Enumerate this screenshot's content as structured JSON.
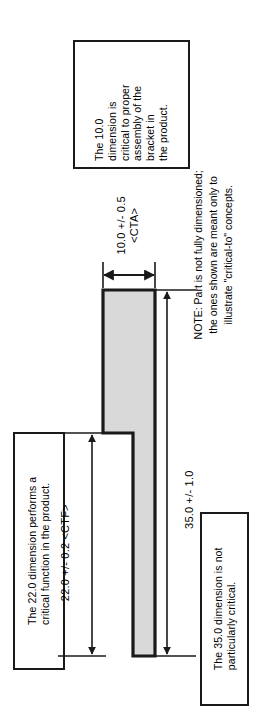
{
  "document": {
    "kind": "engineering-drawing",
    "orientation": "rotated-90-ccw",
    "background_color": "#ffffff",
    "line_color": "#1a1a1a",
    "part_fill_color": "#d9d9d9"
  },
  "part": {
    "name_line_1": "Locator Bracket",
    "name_line_2": "(Front View)",
    "shape": "L-bracket"
  },
  "callouts": [
    {
      "id": "callout-10",
      "lines": [
        "The 10.0",
        "dimension is",
        "critical to proper",
        "assembly of the",
        "bracket in",
        "the product."
      ]
    },
    {
      "id": "callout-22",
      "lines": [
        "The 22.0 dimension performs a",
        "critical function in the product."
      ]
    },
    {
      "id": "callout-35",
      "lines": [
        "The 35.0 dimension is not",
        "particularly critical."
      ]
    }
  ],
  "dimensions": [
    {
      "id": "dim-10",
      "value_line": "10.0 +/- 0.5",
      "tag_line": "<CTA>",
      "nominal": 10.0,
      "tolerance": 0.5,
      "tag": "CTA"
    },
    {
      "id": "dim-22",
      "value_line": "22.0 +/- 0.2 <CTF>",
      "tag_line": "",
      "nominal": 22.0,
      "tolerance": 0.2,
      "tag": "CTF"
    },
    {
      "id": "dim-35",
      "value_line": "35.0 +/- 1.0",
      "tag_line": "",
      "nominal": 35.0,
      "tolerance": 1.0,
      "tag": ""
    }
  ],
  "note": {
    "lines": [
      "NOTE: Part is not fully dimensioned;",
      "the ones shown are meant only to",
      "illustrate \"critical-to\" concepts."
    ]
  }
}
